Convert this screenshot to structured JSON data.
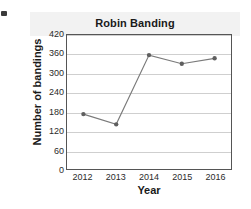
{
  "edge_mark": {
    "name": "scan-artifact"
  },
  "chart_data": {
    "type": "line",
    "title": "Robin Banding",
    "xlabel": "Year",
    "ylabel": "Number of bandings",
    "categories": [
      "2012",
      "2013",
      "2014",
      "2015",
      "2016"
    ],
    "values": [
      172,
      140,
      357,
      330,
      347
    ],
    "ylim": [
      0,
      420
    ],
    "yticks": [
      0,
      60,
      120,
      180,
      240,
      300,
      360,
      420
    ],
    "ytick_labels": [
      "0",
      "60",
      "120",
      "180",
      "240",
      "300",
      "360",
      "420"
    ],
    "grid": "horizontal",
    "legend": "none",
    "series": [
      {
        "name": "bandings",
        "values": [
          172,
          140,
          357,
          330,
          347
        ],
        "line_color": "#7a7a7a",
        "marker_color": "#5f5f5f",
        "marker": "circle"
      }
    ],
    "colors": {
      "line": "#7a7a7a",
      "marker": "#5f5f5f",
      "grid": "#cfcfcf",
      "frame": "#555555",
      "title_band": "#f2f2f2",
      "text": "#1a1a1a"
    }
  }
}
